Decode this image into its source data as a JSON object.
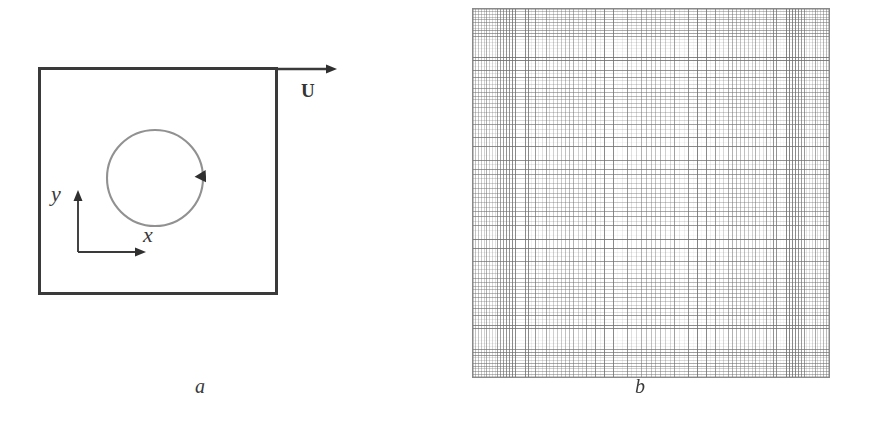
{
  "figure": {
    "background_color": "#ffffff",
    "ink_color": "#3a3a3a",
    "mesh_color": "#6e6e6e"
  },
  "panel_a": {
    "caption": "a",
    "cavity": {
      "border_color": "#3a3a3a",
      "border_width_px": 3
    },
    "lid_velocity": {
      "label": "U",
      "arrow_direction": "right",
      "icon": "right-arrow-icon"
    },
    "vortex": {
      "icon": "circle-with-arrowhead-icon",
      "stroke_color": "#8f8f8f",
      "rotation": "clockwise",
      "arrowhead_position": "right"
    },
    "axes": {
      "x_label": "x",
      "y_label": "y",
      "x_direction": "right",
      "y_direction": "up",
      "color": "#3a3a3a"
    }
  },
  "panel_b": {
    "caption": "b",
    "mesh": {
      "type": "structured-cartesian-grid",
      "columns": 96,
      "rows": 100,
      "line_color": "#6e6e6e",
      "border_color": "#8a8a8a",
      "grading": "refined-toward-boundaries"
    }
  },
  "chart_data": {
    "type": "diagram",
    "title": "",
    "panels": [
      {
        "label": "a",
        "description": "Lid-driven cavity schematic: square domain with top-lid velocity U, interior circular vortex marked with a clockwise arrowhead, and an x-y coordinate frame in the lower-left region.",
        "elements": [
          "cavity-box",
          "lid-velocity-arrow",
          "vortex-circle",
          "x-axis",
          "y-axis"
        ]
      },
      {
        "label": "b",
        "description": "Structured Cartesian computational mesh covering the square cavity, graded with finer cells near the boundaries.",
        "grid_columns": 96,
        "grid_rows": 100
      }
    ]
  }
}
